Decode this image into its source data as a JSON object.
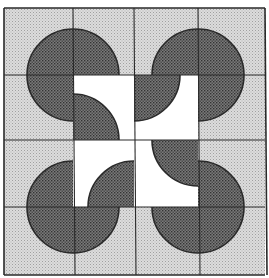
{
  "grid": {
    "rows": 4,
    "cols": 4
  },
  "colors": {
    "light_bg": "#d9d9d9",
    "light_dot": "#a8a8a8",
    "white_bg": "#ffffff",
    "dark_fill": "#6e6e6e",
    "dark_dot": "#3a3a3a",
    "line": "#2a2a2a"
  },
  "tiles": [
    {
      "row": 0,
      "col": 0,
      "background": "light",
      "quarter_corner": "bottom-right"
    },
    {
      "row": 0,
      "col": 1,
      "background": "light",
      "quarter_corner": "bottom-left"
    },
    {
      "row": 0,
      "col": 2,
      "background": "light",
      "quarter_corner": "bottom-right"
    },
    {
      "row": 0,
      "col": 3,
      "background": "light",
      "quarter_corner": "bottom-left"
    },
    {
      "row": 1,
      "col": 0,
      "background": "light",
      "quarter_corner": "top-right"
    },
    {
      "row": 1,
      "col": 1,
      "background": "white",
      "quarter_corner": "bottom-left"
    },
    {
      "row": 1,
      "col": 2,
      "background": "white",
      "quarter_corner": "top-left"
    },
    {
      "row": 1,
      "col": 3,
      "background": "light",
      "quarter_corner": "top-left"
    },
    {
      "row": 2,
      "col": 0,
      "background": "light",
      "quarter_corner": "bottom-right"
    },
    {
      "row": 2,
      "col": 1,
      "background": "white",
      "quarter_corner": "bottom-right"
    },
    {
      "row": 2,
      "col": 2,
      "background": "white",
      "quarter_corner": "top-right"
    },
    {
      "row": 2,
      "col": 3,
      "background": "light",
      "quarter_corner": "bottom-left"
    },
    {
      "row": 3,
      "col": 0,
      "background": "light",
      "quarter_corner": "top-right"
    },
    {
      "row": 3,
      "col": 1,
      "background": "light",
      "quarter_corner": "top-left"
    },
    {
      "row": 3,
      "col": 2,
      "background": "light",
      "quarter_corner": "top-right"
    },
    {
      "row": 3,
      "col": 3,
      "background": "light",
      "quarter_corner": "top-left"
    }
  ]
}
